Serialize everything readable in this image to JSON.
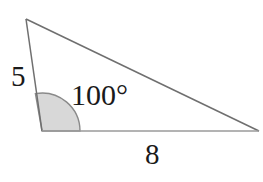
{
  "figure": {
    "kind": "triangle-diagram",
    "background_color": "#ffffff",
    "stroke_color": "#7a7a7a",
    "base_stroke_color": "#9a9a9a",
    "arc_fill_color": "#d8d8d8",
    "arc_stroke_color": "#8a8a8a",
    "text_color": "#1a1a1a"
  },
  "labels": {
    "side_a": "5",
    "angle": "100°",
    "side_b": "8"
  },
  "geometry": {
    "vertices": {
      "apex": {
        "x": 26,
        "y": 19
      },
      "left": {
        "x": 42,
        "y": 131
      },
      "right": {
        "x": 259,
        "y": 131
      }
    },
    "angle_arc": {
      "center": {
        "x": 42,
        "y": 131
      },
      "radius": 38,
      "start_deg": 0,
      "sweep_deg": 100
    }
  }
}
